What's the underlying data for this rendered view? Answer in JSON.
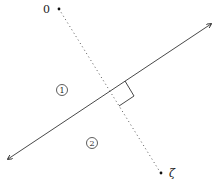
{
  "diagram": {
    "points": [
      {
        "label": "0",
        "x": 59,
        "y": 9
      },
      {
        "label": "ζ",
        "x": 160,
        "y": 173
      }
    ],
    "regions": [
      {
        "label": "①",
        "x": 62,
        "y": 90
      },
      {
        "label": "②",
        "x": 92,
        "y": 143
      }
    ],
    "line": {
      "from": [
        8,
        159
      ],
      "to": [
        211,
        24
      ],
      "arrows": "both"
    },
    "perpendicular": {
      "from": [
        59,
        9
      ],
      "to": [
        160,
        173
      ],
      "style": "dotted"
    },
    "colors": {
      "stroke": "#333333",
      "background": "#ffffff"
    }
  }
}
